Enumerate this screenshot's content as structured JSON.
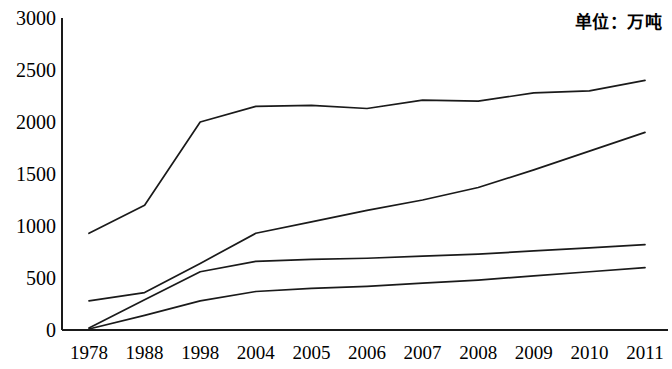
{
  "annotation": {
    "unit_note": "单位：万吨"
  },
  "axis": {
    "y_ticks": [
      "0",
      "500",
      "1000",
      "1500",
      "2000",
      "2500",
      "3000"
    ],
    "x_ticks": [
      "1978",
      "1988",
      "1998",
      "2004",
      "2005",
      "2006",
      "2007",
      "2008",
      "2009",
      "2010",
      "2011"
    ]
  },
  "style": {
    "line_color": "#1a1a1a",
    "axis_color": "#1a1a1a",
    "background": "#ffffff"
  },
  "chart_data": {
    "type": "line",
    "title": "",
    "subtitle": "",
    "annotation": "单位：万吨",
    "xlabel": "",
    "ylabel": "",
    "ylim": [
      0,
      3000
    ],
    "y_ticks": [
      0,
      500,
      1000,
      1500,
      2000,
      2500,
      3000
    ],
    "grid": false,
    "legend": "none",
    "categories": [
      "1978",
      "1988",
      "1998",
      "2004",
      "2005",
      "2006",
      "2007",
      "2008",
      "2009",
      "2010",
      "2011"
    ],
    "series": [
      {
        "name": "series-1",
        "values": [
          930,
          1200,
          2000,
          2150,
          2160,
          2130,
          2210,
          2200,
          2280,
          2300,
          2400
        ]
      },
      {
        "name": "series-2",
        "values": [
          280,
          360,
          640,
          930,
          1040,
          1150,
          1250,
          1370,
          1540,
          1720,
          1900
        ]
      },
      {
        "name": "series-3",
        "values": [
          20,
          290,
          560,
          660,
          680,
          690,
          710,
          730,
          760,
          790,
          820
        ]
      },
      {
        "name": "series-4",
        "values": [
          10,
          140,
          280,
          370,
          400,
          420,
          450,
          480,
          520,
          560,
          600
        ]
      }
    ]
  }
}
